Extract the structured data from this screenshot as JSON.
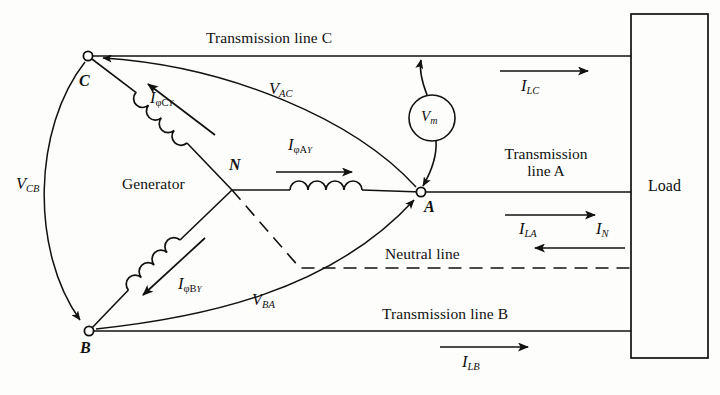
{
  "figure": {
    "type": "circuit-schematic",
    "background_color": "#fdfdfb",
    "stroke_color": "#111111"
  },
  "nodes": [
    {
      "id": "C",
      "label": "C",
      "x": 88,
      "y": 56
    },
    {
      "id": "N",
      "label": "N",
      "x": 232,
      "y": 190
    },
    {
      "id": "A",
      "label": "A",
      "x": 421,
      "y": 192
    },
    {
      "id": "B",
      "label": "B",
      "x": 89,
      "y": 331
    }
  ],
  "labels": {
    "generator": "Generator",
    "load": "Load",
    "neutral_line": "Neutral line",
    "transmission_line_c": "Transmission line C",
    "transmission_line_a_l1": "Transmission",
    "transmission_line_a_l2": "line A",
    "transmission_line_b": "Transmission line B"
  },
  "meter": {
    "name": "voltmeter",
    "symbol": "V",
    "subscript": "m"
  },
  "phase_currents": [
    {
      "id": "IphiC",
      "symbol": "I",
      "subscript": "φC",
      "mark": "Y",
      "direction": "toward-C"
    },
    {
      "id": "IphiA",
      "symbol": "I",
      "subscript": "φA",
      "mark": "Y",
      "direction": "toward-A"
    },
    {
      "id": "IphiB",
      "symbol": "I",
      "subscript": "φB",
      "mark": "Y",
      "direction": "toward-B"
    }
  ],
  "line_currents": [
    {
      "id": "ILC",
      "symbol": "I",
      "subscript": "LC",
      "direction": "right"
    },
    {
      "id": "ILA",
      "symbol": "I",
      "subscript": "LA",
      "direction": "right"
    },
    {
      "id": "IN",
      "symbol": "I",
      "subscript": "N",
      "direction": "left"
    },
    {
      "id": "ILB",
      "symbol": "I",
      "subscript": "LB",
      "direction": "right"
    }
  ],
  "line_voltages": [
    {
      "id": "VCB",
      "symbol": "V",
      "subscript": "CB",
      "from": "C",
      "to": "B"
    },
    {
      "id": "VAC",
      "symbol": "V",
      "subscript": "AC",
      "from": "A",
      "to": "C"
    },
    {
      "id": "VBA",
      "symbol": "V",
      "subscript": "BA",
      "from": "B",
      "to": "A"
    }
  ]
}
